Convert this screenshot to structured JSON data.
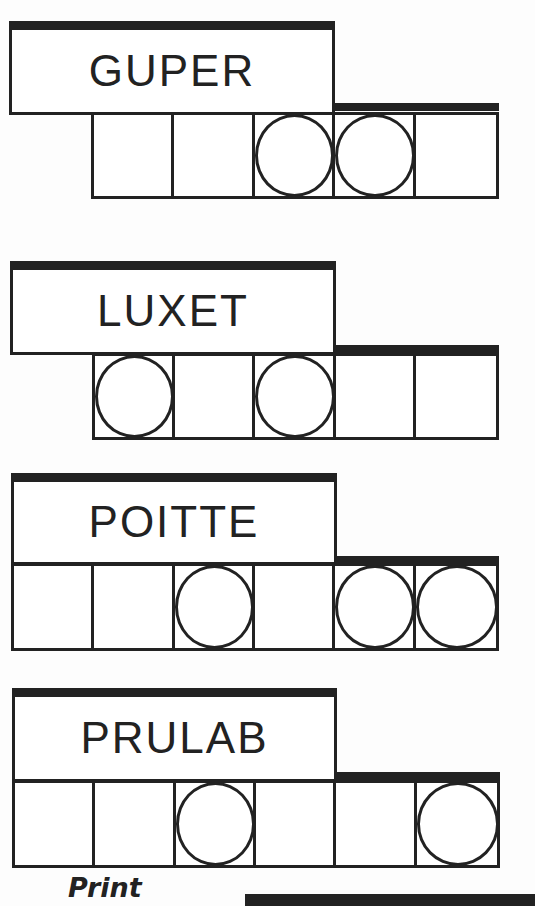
{
  "puzzle_type": "Jumble",
  "clues": [
    {
      "scrambled": "GUPER",
      "letters": 5,
      "circled": [
        3,
        4
      ]
    },
    {
      "scrambled": "LUXET",
      "letters": 5,
      "circled": [
        1,
        3
      ]
    },
    {
      "scrambled": "POITTE",
      "letters": 6,
      "circled": [
        3,
        5,
        6
      ]
    },
    {
      "scrambled": "PRULAB",
      "letters": 6,
      "circled": [
        3,
        6
      ]
    }
  ],
  "footer": {
    "print_label": "Print"
  },
  "colors": {
    "ink": "#222222",
    "paper": "#fdfdfd"
  }
}
